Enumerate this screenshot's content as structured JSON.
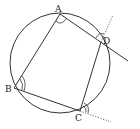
{
  "diagram": {
    "type": "cyclic-quadrilateral",
    "circle": {
      "cx": 60,
      "cy": 63,
      "r": 50
    },
    "points": {
      "A": {
        "label": "A",
        "x": 60,
        "y": 14
      },
      "B": {
        "label": "B",
        "x": 14,
        "y": 88
      },
      "C": {
        "label": "C",
        "x": 80,
        "y": 111
      },
      "D": {
        "label": "D",
        "x": 101,
        "y": 42
      }
    },
    "extensions": {
      "AD_extended_to": {
        "x": 128,
        "y": 61
      },
      "CD_extended_dotted_to": {
        "x": 113,
        "y": 15
      },
      "BC_extended_dotted_to": {
        "x": 111,
        "y": 122
      }
    },
    "stroke_color": "#333333"
  }
}
